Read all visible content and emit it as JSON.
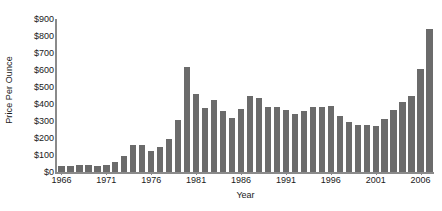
{
  "chart_data": {
    "type": "bar",
    "title": "",
    "xlabel": "Year",
    "ylabel": "Price Per Ounce",
    "ylim": [
      0,
      900
    ],
    "grid": false,
    "legend": null,
    "y_ticks": [
      0,
      100,
      200,
      300,
      400,
      500,
      600,
      700,
      800,
      900
    ],
    "y_tick_labels": [
      "$0",
      "$100",
      "$200",
      "$300",
      "$400",
      "$500",
      "$600",
      "$700",
      "$800",
      "$900"
    ],
    "x_tick_labels": [
      "1966",
      "1971",
      "1976",
      "1981",
      "1986",
      "1991",
      "1996",
      "2001",
      "2006"
    ],
    "x_tick_values": [
      1966,
      1971,
      1976,
      1981,
      1986,
      1991,
      1996,
      2001,
      2006
    ],
    "bar_color": "#6b6b6b",
    "axis_color": "#8a8a8a",
    "text_color": "#1a1a1a",
    "background_color": "#ffffff",
    "categories": [
      1966,
      1967,
      1968,
      1969,
      1970,
      1971,
      1972,
      1973,
      1974,
      1975,
      1976,
      1977,
      1978,
      1979,
      1980,
      1981,
      1982,
      1983,
      1984,
      1985,
      1986,
      1987,
      1988,
      1989,
      1990,
      1991,
      1992,
      1993,
      1994,
      1995,
      1996,
      1997,
      1998,
      1999,
      2000,
      2001,
      2002,
      2003,
      2004,
      2005,
      2006,
      2007
    ],
    "values": [
      35,
      35,
      39,
      41,
      36,
      41,
      58,
      97,
      159,
      161,
      125,
      148,
      193,
      306,
      615,
      460,
      376,
      424,
      361,
      317,
      368,
      447,
      437,
      381,
      384,
      362,
      344,
      360,
      384,
      384,
      388,
      331,
      294,
      279,
      279,
      271,
      310,
      363,
      410,
      445,
      604,
      840
    ],
    "series_name": "Gold price per ounce"
  }
}
